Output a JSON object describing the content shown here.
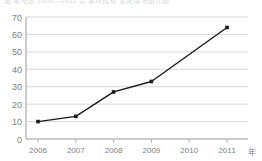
{
  "caption": {
    "text": "图 某地区 2006—2011 年 某项指标 变化情况统计图"
  },
  "chart_data": {
    "type": "line",
    "title": "",
    "xlabel": "年",
    "ylabel": "",
    "categories": [
      "2006",
      "2007",
      "2008",
      "2009",
      "2010",
      "2011"
    ],
    "x": [
      2006,
      2007,
      2008,
      2009,
      2010,
      2011
    ],
    "values": [
      10,
      13,
      27,
      33,
      null,
      64
    ],
    "series": [
      {
        "name": "",
        "values": [
          10,
          13,
          27,
          33,
          null,
          64
        ]
      }
    ],
    "points": [
      {
        "x": "2006",
        "y": 10
      },
      {
        "x": "2007",
        "y": 13
      },
      {
        "x": "2008",
        "y": 27
      },
      {
        "x": "2009",
        "y": 33
      },
      {
        "x": "2011",
        "y": 64
      }
    ],
    "ylim": [
      0,
      70
    ],
    "yticks": [
      0,
      10,
      20,
      30,
      40,
      50,
      60,
      70
    ],
    "ytick_labels": [
      "0",
      "10",
      "20",
      "30",
      "40",
      "50",
      "60",
      "70"
    ],
    "xtick_labels": [
      "2006",
      "2007",
      "2008",
      "2009",
      "2010",
      "2011"
    ],
    "grid": "horizontal",
    "legend": "none",
    "line_color": "#1a1a1a",
    "marker": "square",
    "marker_color": "#1a1a1a",
    "grid_color": "#d6d6d6",
    "axis_color": "#9a9a9a",
    "background": "#ffffff"
  },
  "axis": {
    "y_labels": [
      "70",
      "60",
      "50",
      "40",
      "30",
      "20",
      "10",
      "0"
    ],
    "x_labels": [
      "2006",
      "2007",
      "2008",
      "2009",
      "2010",
      "2011"
    ],
    "unit_label": "年"
  }
}
